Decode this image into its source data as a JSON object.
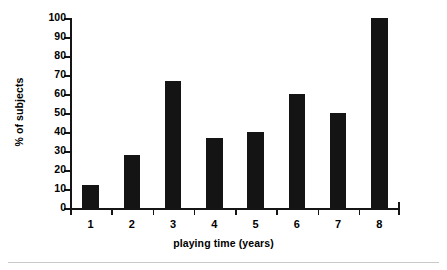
{
  "chart_data": {
    "type": "bar",
    "title": "",
    "xlabel": "playing time (years)",
    "ylabel": "% of subjects",
    "categories": [
      "1",
      "2",
      "3",
      "4",
      "5",
      "6",
      "7",
      "8"
    ],
    "values": [
      12,
      28,
      67,
      37,
      40,
      60,
      50,
      100
    ],
    "ylim": [
      0,
      100
    ],
    "yticks": [
      0,
      10,
      20,
      30,
      40,
      50,
      60,
      70,
      80,
      90,
      100
    ],
    "ytick_labels": [
      "0",
      "10",
      "20",
      "30",
      "40",
      "50",
      "60",
      "70",
      "80",
      "90",
      "100"
    ],
    "grid": false,
    "legend": null,
    "series": [
      {
        "name": "% of subjects",
        "values": [
          12,
          28,
          67,
          37,
          40,
          60,
          50,
          100
        ],
        "color": "#141414"
      }
    ],
    "bar_color": "#141414",
    "axis_color": "#151515",
    "background": "#ffffff"
  },
  "figure": {
    "y_axis_title": "% of subjects",
    "x_axis_title": "playing time (years)"
  }
}
